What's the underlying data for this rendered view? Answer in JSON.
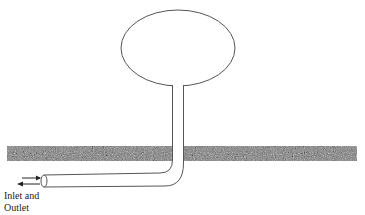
{
  "diagram": {
    "type": "buried-pipe-with-balloon",
    "label": {
      "line1": "Inlet and",
      "line2": "Outlet"
    },
    "colors": {
      "stroke": "#555555",
      "ground_dark": "#3a3a3a",
      "ground_light": "#9a9a9a",
      "background": "#ffffff"
    },
    "elements": [
      "balloon-ellipse",
      "vertical-pipe",
      "ground-layer",
      "horizontal-pipe",
      "pipe-open-end",
      "inlet-arrow",
      "outlet-arrow"
    ]
  }
}
